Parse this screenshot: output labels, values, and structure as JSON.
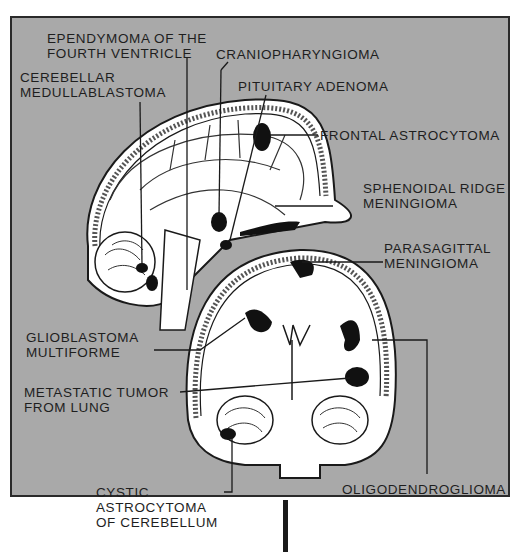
{
  "figure": {
    "background_color": "#a9a9a9",
    "tumor_color": "#111111"
  },
  "labels": {
    "ependymoma": {
      "line1": "EPENDYMOMA OF THE",
      "line2": "FOURTH VENTRICLE"
    },
    "craniopharyngioma": {
      "line1": "CRANIOPHARYNGIOMA"
    },
    "cerebellar_medulloblastoma": {
      "line1": "CEREBELLAR",
      "line2": "MEDULLABLASTOMA"
    },
    "pituitary_adenoma": {
      "line1": "PITUITARY ADENOMA"
    },
    "frontal_astrocytoma": {
      "line1": "FRONTAL ASTROCYTOMA"
    },
    "sphenoidal_ridge_meningioma": {
      "line1": "SPHENOIDAL RIDGE",
      "line2": "MENINGIOMA"
    },
    "parasagittal_meningioma": {
      "line1": "PARASAGITTAL",
      "line2": "MENINGIOMA"
    },
    "glioblastoma_multiforme": {
      "line1": "GLIOBLASTOMA",
      "line2": "MULTIFORME"
    },
    "metastatic_tumor": {
      "line1": "METASTATIC TUMOR",
      "line2": "FROM LUNG"
    },
    "oligodendroglioma": {
      "line1": "OLIGODENDROGLIOMA"
    },
    "cystic_astrocytoma": {
      "line1": "CYSTIC",
      "line2": "ASTROCYTOMA",
      "line3": "OF CEREBELLUM"
    }
  }
}
